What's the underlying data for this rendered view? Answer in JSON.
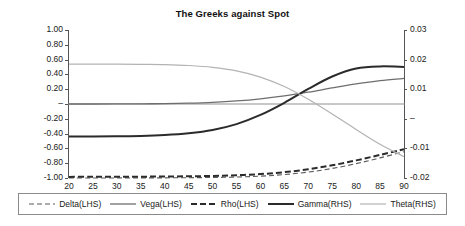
{
  "chart_data": {
    "type": "line",
    "title": "The Greeks against Spot",
    "xlabel": "",
    "ylabel": "",
    "grid": false,
    "legend_position": "bottom",
    "x": [
      20,
      25,
      30,
      35,
      40,
      45,
      50,
      55,
      60,
      65,
      70,
      75,
      80,
      85,
      90
    ],
    "xlim": [
      20,
      90
    ],
    "xticks": [
      "20",
      "25",
      "30",
      "35",
      "40",
      "45",
      "50",
      "55",
      "60",
      "65",
      "70",
      "75",
      "80",
      "85",
      "90"
    ],
    "left_axis": {
      "name": "LHS",
      "lim": [
        -1.0,
        1.0
      ],
      "ticks": [
        "1.00",
        "0.80",
        "0.60",
        "0.40",
        "0.20",
        "–",
        "-0.20",
        "-0.40",
        "-0.60",
        "-0.80",
        "-1.00"
      ],
      "tick_values": [
        1.0,
        0.8,
        0.6,
        0.4,
        0.2,
        0,
        -0.2,
        -0.4,
        -0.6,
        -0.8,
        -1.0
      ]
    },
    "right_axis": {
      "name": "RHS",
      "lim": [
        -0.02,
        0.03
      ],
      "ticks": [
        "0.03",
        "0.02",
        "0.01",
        "–",
        "-0.01",
        "-0.02"
      ],
      "tick_values": [
        0.03,
        0.02,
        0.01,
        0,
        -0.01,
        -0.02
      ]
    },
    "series": [
      {
        "name": "Delta(LHS)",
        "axis": "left",
        "style": "dashed",
        "width": 1.1,
        "color": "#5a5a5a",
        "values": [
          -1.0,
          -1.0,
          -0.999,
          -0.999,
          -0.998,
          -0.996,
          -0.993,
          -0.987,
          -0.975,
          -0.954,
          -0.92,
          -0.871,
          -0.806,
          -0.728,
          -0.645
        ]
      },
      {
        "name": "Vega(LHS)",
        "axis": "left",
        "style": "solid",
        "width": 1.3,
        "color": "#6e6e6e",
        "values": [
          0.0,
          0.0,
          0.001,
          0.002,
          0.005,
          0.011,
          0.022,
          0.041,
          0.07,
          0.11,
          0.16,
          0.217,
          0.271,
          0.315,
          0.345
        ]
      },
      {
        "name": "Rho(LHS)",
        "axis": "left",
        "style": "dashed",
        "width": 2.0,
        "color": "#2b2b2b",
        "values": [
          -0.985,
          -0.984,
          -0.983,
          -0.982,
          -0.98,
          -0.977,
          -0.972,
          -0.963,
          -0.947,
          -0.921,
          -0.882,
          -0.828,
          -0.762,
          -0.688,
          -0.612
        ]
      },
      {
        "name": "Gamma(RHS)",
        "axis": "right",
        "style": "solid",
        "width": 2.0,
        "color": "#2b2b2b",
        "values": [
          -0.006,
          -0.006,
          -0.0059,
          -0.0058,
          -0.0055,
          -0.0049,
          -0.0038,
          -0.0018,
          0.0013,
          0.0054,
          0.0101,
          0.0143,
          0.017,
          0.0177,
          0.0175
        ]
      },
      {
        "name": "Theta(RHS)",
        "axis": "right",
        "style": "solid",
        "width": 1.2,
        "color": "#b3b3b3",
        "values": [
          0.0185,
          0.0185,
          0.0185,
          0.0184,
          0.0183,
          0.018,
          0.0174,
          0.0162,
          0.0141,
          0.0109,
          0.0066,
          0.0016,
          -0.0036,
          -0.0086,
          -0.0128
        ]
      }
    ]
  }
}
